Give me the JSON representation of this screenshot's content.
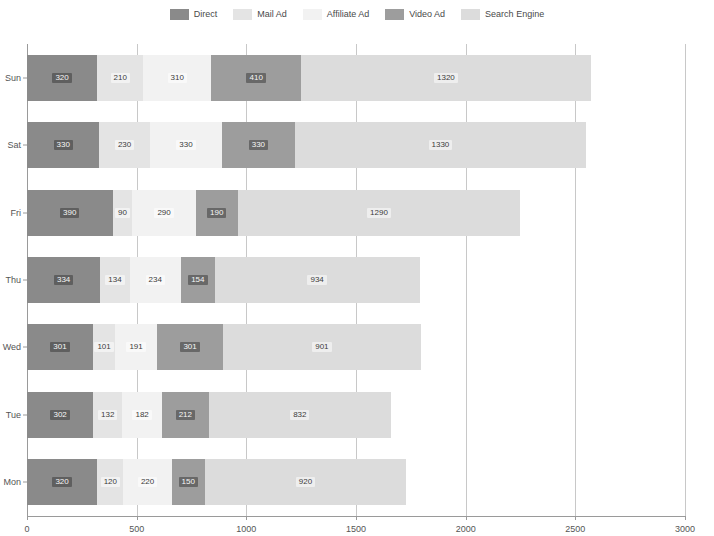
{
  "chart_data": {
    "type": "bar",
    "orientation": "horizontal",
    "stacked": true,
    "title": "",
    "xlabel": "",
    "ylabel": "",
    "categories": [
      "Sun",
      "Sat",
      "Fri",
      "Thu",
      "Wed",
      "Tue",
      "Mon"
    ],
    "series": [
      {
        "name": "Direct",
        "color": "#8a8a8a",
        "values": [
          320,
          330,
          390,
          334,
          301,
          302,
          320
        ]
      },
      {
        "name": "Mail Ad",
        "color": "#e4e4e4",
        "values": [
          210,
          230,
          90,
          134,
          101,
          132,
          120
        ]
      },
      {
        "name": "Affiliate Ad",
        "color": "#f2f2f2",
        "values": [
          310,
          330,
          290,
          234,
          191,
          182,
          220
        ]
      },
      {
        "name": "Video Ad",
        "color": "#9d9d9d",
        "values": [
          410,
          330,
          190,
          154,
          301,
          212,
          150
        ]
      },
      {
        "name": "Search Engine",
        "color": "#dcdcdc",
        "values": [
          1320,
          1330,
          1290,
          934,
          901,
          832,
          920
        ]
      }
    ],
    "totals": [
      2570,
      2550,
      2250,
      1790,
      1795,
      1660,
      1730
    ],
    "xlim": [
      0,
      3000
    ],
    "xticks": [
      0,
      500,
      1000,
      1500,
      2000,
      2500,
      3000
    ],
    "xtick_labels": [
      "0",
      "500",
      "1000",
      "1500",
      "2000",
      "2500",
      "3000"
    ],
    "grid": true,
    "legend_position": "top"
  },
  "legend": {
    "items": [
      {
        "label": "Direct",
        "color": "#8a8a8a"
      },
      {
        "label": "Mail Ad",
        "color": "#e4e4e4"
      },
      {
        "label": "Affiliate Ad",
        "color": "#f2f2f2"
      },
      {
        "label": "Video Ad",
        "color": "#9d9d9d"
      },
      {
        "label": "Search Engine",
        "color": "#dcdcdc"
      }
    ]
  }
}
